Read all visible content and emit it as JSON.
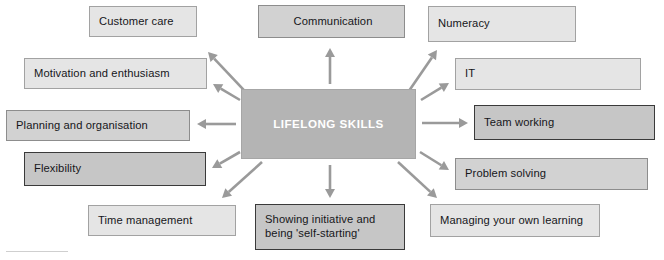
{
  "diagram": {
    "title": "LIFELONG SKILLS",
    "type": "hub-and-spoke mind map",
    "center": {
      "label": "LIFELONG SKILLS",
      "x": 241,
      "y": 89,
      "w": 175,
      "h": 70,
      "fill": "#b4b4b4",
      "border": "#a6a6a6",
      "text_color": "#ffffff"
    },
    "palette": {
      "light": "#e5e5e5",
      "mid": "#d2d2d2",
      "dark_fill": "#c6c6c6",
      "dark_border": "#3a3a3a",
      "arrow": "#9a9a9a",
      "page_background": "#ffffff",
      "text": "#16161a"
    },
    "nodes": [
      {
        "id": "customer-care",
        "label": "Customer care",
        "x": 89,
        "y": 6,
        "w": 108,
        "h": 31,
        "tone": "light"
      },
      {
        "id": "communication",
        "label": "Communication",
        "x": 258,
        "y": 5,
        "w": 147,
        "h": 33,
        "tone": "mid",
        "align": "center"
      },
      {
        "id": "numeracy",
        "label": "Numeracy",
        "x": 428,
        "y": 6,
        "w": 148,
        "h": 36,
        "tone": "light"
      },
      {
        "id": "motivation",
        "label": "Motivation and enthusiasm",
        "x": 24,
        "y": 58,
        "w": 183,
        "h": 31,
        "tone": "light"
      },
      {
        "id": "it",
        "label": "IT",
        "x": 455,
        "y": 58,
        "w": 186,
        "h": 32,
        "tone": "light"
      },
      {
        "id": "planning",
        "label": "Planning and organisation",
        "x": 6,
        "y": 110,
        "w": 184,
        "h": 31,
        "tone": "mid"
      },
      {
        "id": "team-working",
        "label": "Team working",
        "x": 474,
        "y": 105,
        "w": 181,
        "h": 35,
        "tone": "dark"
      },
      {
        "id": "flexibility",
        "label": "Flexibility",
        "x": 24,
        "y": 152,
        "w": 182,
        "h": 34,
        "tone": "dark"
      },
      {
        "id": "problem-solving",
        "label": "Problem solving",
        "x": 455,
        "y": 158,
        "w": 193,
        "h": 32,
        "tone": "mid"
      },
      {
        "id": "time-management",
        "label": "Time management",
        "x": 88,
        "y": 205,
        "w": 148,
        "h": 31,
        "tone": "light"
      },
      {
        "id": "showing-initiative",
        "label": "Showing initiative and\nbeing 'self-starting'",
        "x": 255,
        "y": 204,
        "w": 150,
        "h": 46,
        "tone": "dark"
      },
      {
        "id": "managing-learning",
        "label": "Managing your own learning",
        "x": 430,
        "y": 204,
        "w": 170,
        "h": 33,
        "tone": "light"
      }
    ],
    "arrows": [
      {
        "id": "arrow-to-customer-care",
        "from": "center",
        "to": "customer-care",
        "x1": 258,
        "y1": 105,
        "x2": 208,
        "y2": 52
      },
      {
        "id": "arrow-to-communication",
        "from": "center",
        "to": "communication",
        "x1": 330,
        "y1": 84,
        "x2": 330,
        "y2": 48
      },
      {
        "id": "arrow-to-numeracy",
        "from": "center",
        "to": "numeracy",
        "x1": 400,
        "y1": 104,
        "x2": 437,
        "y2": 50
      },
      {
        "id": "arrow-to-motivation",
        "from": "center",
        "to": "motivation",
        "x1": 240,
        "y1": 100,
        "x2": 213,
        "y2": 84
      },
      {
        "id": "arrow-to-it",
        "from": "center",
        "to": "it",
        "x1": 421,
        "y1": 100,
        "x2": 449,
        "y2": 83
      },
      {
        "id": "arrow-to-planning",
        "from": "center",
        "to": "planning",
        "x1": 236,
        "y1": 124,
        "x2": 197,
        "y2": 124
      },
      {
        "id": "arrow-to-team-working",
        "from": "center",
        "to": "team-working",
        "x1": 422,
        "y1": 123,
        "x2": 468,
        "y2": 123
      },
      {
        "id": "arrow-to-flexibility",
        "from": "center",
        "to": "flexibility",
        "x1": 240,
        "y1": 152,
        "x2": 212,
        "y2": 168
      },
      {
        "id": "arrow-to-problem-solving",
        "from": "center",
        "to": "problem-solving",
        "x1": 420,
        "y1": 152,
        "x2": 449,
        "y2": 170
      },
      {
        "id": "arrow-to-time-management",
        "from": "center",
        "to": "time-management",
        "x1": 262,
        "y1": 162,
        "x2": 222,
        "y2": 198
      },
      {
        "id": "arrow-to-showing-initiative",
        "from": "center",
        "to": "showing-initiative",
        "x1": 330,
        "y1": 165,
        "x2": 330,
        "y2": 198
      },
      {
        "id": "arrow-to-managing-learning",
        "from": "center",
        "to": "managing-learning",
        "x1": 398,
        "y1": 162,
        "x2": 437,
        "y2": 198
      }
    ]
  }
}
